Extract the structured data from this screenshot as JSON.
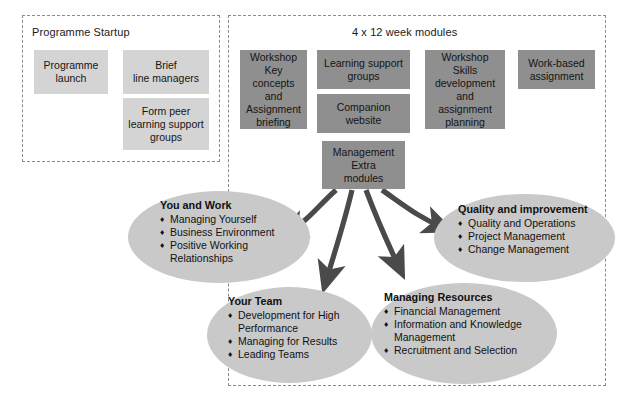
{
  "diagram": {
    "colors": {
      "box_light": "#d4d4d4",
      "box_dark": "#8f8f8f",
      "ellipse": "#c9c9c9",
      "arrow": "#4a4a4a",
      "panel_border": "#8a8a8a"
    }
  },
  "panels": [
    {
      "id": "startup",
      "title": "Programme Startup"
    },
    {
      "id": "modules",
      "title": "4 x 12 week modules"
    }
  ],
  "startup_boxes": [
    {
      "id": "programme-launch",
      "label": "Programme\nlaunch",
      "shade": "light"
    },
    {
      "id": "brief-line-managers",
      "label": "Brief\nline managers",
      "shade": "light"
    },
    {
      "id": "form-peer-groups",
      "label": "Form peer\nlearning support\ngroups",
      "shade": "light"
    }
  ],
  "module_boxes": [
    {
      "id": "workshop-key-concepts",
      "label": "Workshop\nKey concepts\nand\nAssignment\nbriefing",
      "shade": "dark"
    },
    {
      "id": "learning-support-groups",
      "label": "Learning support\ngroups",
      "shade": "dark"
    },
    {
      "id": "companion-website",
      "label": "Companion\nwebsite",
      "shade": "dark"
    },
    {
      "id": "management-extra-modules",
      "label": "Management\nExtra\nmodules",
      "shade": "dark"
    },
    {
      "id": "workshop-skills",
      "label": "Workshop\nSkills\ndevelopment\nand assignment\nplanning",
      "shade": "dark"
    },
    {
      "id": "work-based-assignment",
      "label": "Work-based\nassignment",
      "shade": "dark"
    }
  ],
  "themes": [
    {
      "id": "you-and-work",
      "title": "You and Work",
      "items": [
        "Managing Yourself",
        "Business Environment",
        "Positive Working\nRelationships"
      ]
    },
    {
      "id": "quality-and-improvement",
      "title": "Quality and improvement",
      "items": [
        "Quality and Operations",
        "Project Management",
        "Change Management"
      ]
    },
    {
      "id": "your-team",
      "title": "Your Team",
      "items": [
        "Development for High\nPerformance",
        "Managing for Results",
        "Leading Teams"
      ]
    },
    {
      "id": "managing-resources",
      "title": "Managing Resources",
      "items": [
        "Financial Management",
        "Information and Knowledge\nManagement",
        "Recruitment and Selection"
      ]
    }
  ],
  "bullet_glyph": "♦"
}
